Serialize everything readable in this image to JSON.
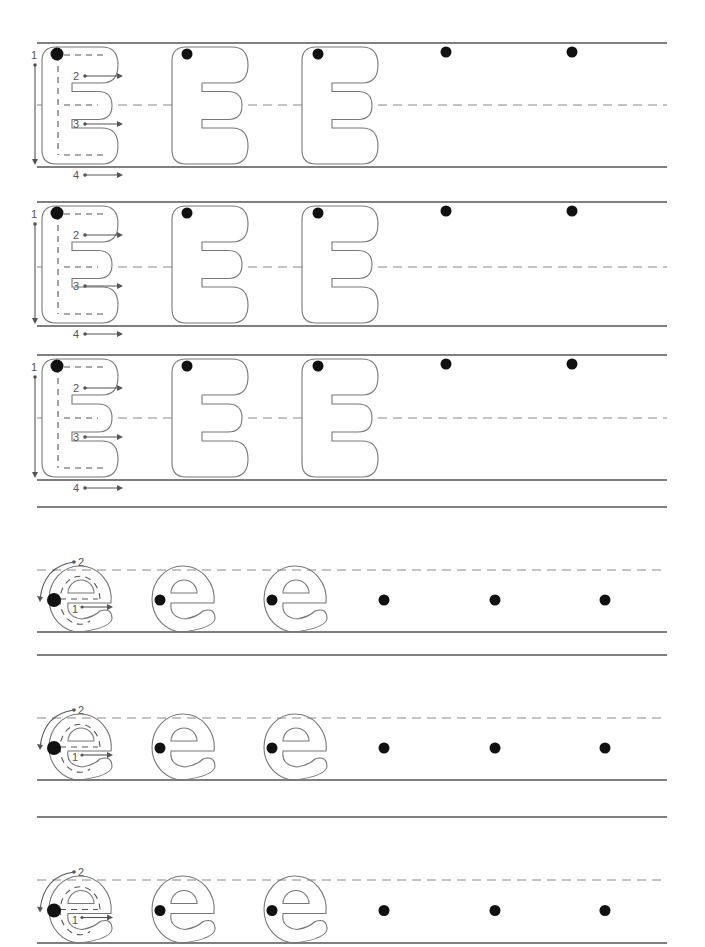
{
  "worksheet": {
    "letter_upper": "E",
    "letter_lower": "e",
    "colors": {
      "rule": "#555555",
      "dash": "#888888",
      "outline": "#777777",
      "dot": "#111111"
    },
    "upper_rows": [
      {
        "top": 43,
        "mid": 105,
        "base": 167,
        "stroke_numbers": [
          "1",
          "2",
          "3",
          "4"
        ]
      },
      {
        "top": 202,
        "mid": 267,
        "base": 326,
        "stroke_numbers": [
          "1",
          "2",
          "3",
          "4"
        ]
      },
      {
        "top": 355,
        "mid": 418,
        "base": 480,
        "stroke_numbers": [
          "1",
          "2",
          "3",
          "4"
        ]
      }
    ],
    "lower_rows": [
      {
        "dash": 570,
        "base": 632,
        "under": 655,
        "stroke_numbers": [
          "1",
          "2"
        ]
      },
      {
        "dash": 718,
        "base": 780,
        "under": 817,
        "stroke_numbers": [
          "1",
          "2"
        ]
      },
      {
        "dash": 880,
        "base": 943,
        "under": null,
        "stroke_numbers": [
          "1",
          "2"
        ]
      }
    ],
    "separator_line": 507,
    "upper_dot_x": [
      57,
      187,
      318,
      446,
      572
    ],
    "lower_dot_x": [
      54,
      160,
      272,
      384,
      495,
      605
    ]
  }
}
